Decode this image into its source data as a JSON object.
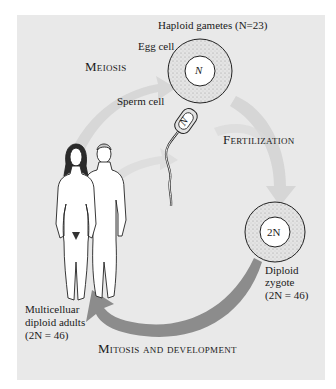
{
  "figure": {
    "title": "Haploid gametes (N=23)",
    "stages": {
      "meiosis": "Meiosis",
      "fertilization": "Fertilization",
      "mitosis": "Mitosis and development"
    },
    "cells": {
      "egg": {
        "label": "Egg cell",
        "nucleus": "N"
      },
      "sperm": {
        "label": "Sperm cell",
        "nucleus": "N"
      },
      "zygote": {
        "label_line1": "Diploid",
        "label_line2": "zygote",
        "label_line3": "(2N = 46)",
        "nucleus": "2N"
      }
    },
    "adults": {
      "label_line1": "Multicelluar",
      "label_line2": "diploid adults",
      "label_line3": "(2N = 46)"
    },
    "colors": {
      "background": "#e9e9e9",
      "faint_arrow": "#d2d2d2",
      "main_arrow": "#8c8c8c",
      "cell_fill": "#dadada",
      "outline": "#222222"
    }
  }
}
